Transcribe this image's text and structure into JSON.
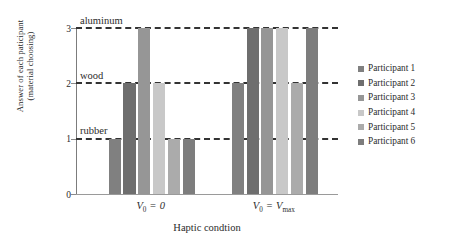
{
  "chart_data": {
    "type": "bar",
    "title": "",
    "xlabel": "Haptic condtion",
    "ylabel_lines": [
      "Answer of each paticipant",
      "(material choosing)"
    ],
    "categories": [
      "V0 = 0",
      "V0 = Vmax"
    ],
    "ylim": [
      0,
      3
    ],
    "yticks": [
      0,
      1,
      2,
      3
    ],
    "ytick_labels": [
      "0",
      "1",
      "2",
      "3"
    ],
    "grid": "dashed horizontal at 1, 2, 3",
    "legend_position": "right",
    "value_labels": {
      "1": "rubber",
      "2": "wood",
      "3": "aluminum"
    },
    "series": [
      {
        "name": "Participant 1",
        "color": "#808080",
        "values": [
          1,
          2
        ]
      },
      {
        "name": "Participant 2",
        "color": "#6e6e6e",
        "values": [
          2,
          3
        ]
      },
      {
        "name": "Participant 3",
        "color": "#969696",
        "values": [
          3,
          3
        ]
      },
      {
        "name": "Participant 4",
        "color": "#c8c8c8",
        "values": [
          2,
          3
        ]
      },
      {
        "name": "Participant 5",
        "color": "#ababab",
        "values": [
          1,
          2
        ]
      },
      {
        "name": "Participant 6",
        "color": "#7d7d7d",
        "values": [
          1,
          3
        ]
      }
    ]
  },
  "axis": {
    "material_labels": [
      {
        "text": "aluminum",
        "value": 3
      },
      {
        "text": "wood",
        "value": 2
      },
      {
        "text": "rubber",
        "value": 1
      }
    ],
    "xtick_parts": [
      {
        "v": "V",
        "sub": "0",
        "eq": "=",
        "rhs": "0",
        "rhs_sub": ""
      },
      {
        "v": "V",
        "sub": "0",
        "eq": "=",
        "rhs": "V",
        "rhs_sub": "max"
      }
    ]
  }
}
